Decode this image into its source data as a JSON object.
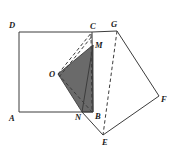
{
  "figure": {
    "canvas": {
      "width": 176,
      "height": 153
    },
    "colors": {
      "stroke": "#3c3c3c",
      "shade_fill": "#6a6a6a",
      "background": "#ffffff",
      "label": "#1a1a1a"
    },
    "points": {
      "A": {
        "x": 19,
        "y": 112,
        "label": "A",
        "label_x": 9,
        "label_y": 114
      },
      "B": {
        "x": 93,
        "y": 112,
        "label": "B",
        "label_x": 95,
        "label_y": 112
      },
      "C": {
        "x": 92,
        "y": 32,
        "label": "C",
        "label_x": 90,
        "label_y": 22
      },
      "D": {
        "x": 19,
        "y": 32,
        "label": "D",
        "label_x": 9,
        "label_y": 21
      },
      "E": {
        "x": 103,
        "y": 135,
        "label": "E",
        "label_x": 102,
        "label_y": 138
      },
      "F": {
        "x": 159,
        "y": 96,
        "label": "F",
        "label_x": 161,
        "label_y": 95
      },
      "G": {
        "x": 117,
        "y": 31,
        "label": "G",
        "label_x": 111,
        "label_y": 20
      },
      "M": {
        "x": 93,
        "y": 45,
        "label": "M",
        "label_x": 95,
        "label_y": 41
      },
      "N": {
        "x": 82,
        "y": 112,
        "label": "N",
        "label_x": 75,
        "label_y": 113
      },
      "O": {
        "x": 58,
        "y": 74,
        "label": "O",
        "label_x": 49,
        "label_y": 70
      }
    },
    "shapes": {
      "square_abcd": "19,112 19,32 92,32 92,112",
      "square_bgfe": "93,112 117,31 159,96 103,135",
      "shaded_region": "58,74 93,45 93,112 82,112"
    },
    "solid_edges": [
      "19,32 92,32",
      "19,32 19,112",
      "19,112 93,112",
      "92,32 93,112",
      "92,32 117,31",
      "117,31 159,96",
      "159,96 103,135",
      "103,135 82,112",
      "93,45 82,112"
    ],
    "dashed_edges": [
      "58,74 92,32",
      "92,32 93,112",
      "117,31 103,135",
      "58,74 93,112"
    ]
  }
}
